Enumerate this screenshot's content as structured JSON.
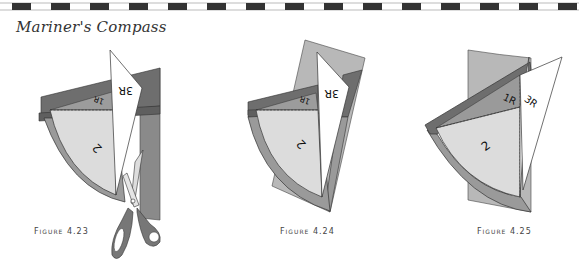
{
  "page": {
    "title": "Mariner's Compass",
    "top_border": "dashed-band"
  },
  "colors": {
    "dark_band": "#6e6e6e",
    "mid_gray": "#8f8f8f",
    "light_wedge": "#dcdcdc",
    "arc_strip": "#9a9a9a",
    "background_strip": "#b8b8b8",
    "white_piece": "#ffffff",
    "outline": "#333333"
  },
  "figures": [
    {
      "id": "4.23",
      "caption": "Figure 4.23",
      "labels": {
        "piece_2": "2",
        "piece_1r": "1R",
        "piece_3r": "3R"
      },
      "icons": [
        "scissors-icon"
      ]
    },
    {
      "id": "4.24",
      "caption": "Figure 4.24",
      "labels": {
        "piece_2": "2",
        "piece_1r": "1R",
        "piece_3r": "3R"
      }
    },
    {
      "id": "4.25",
      "caption": "Figure 4.25",
      "labels": {
        "piece_2": "2",
        "piece_1r": "1R",
        "piece_3r": "3R"
      }
    }
  ]
}
